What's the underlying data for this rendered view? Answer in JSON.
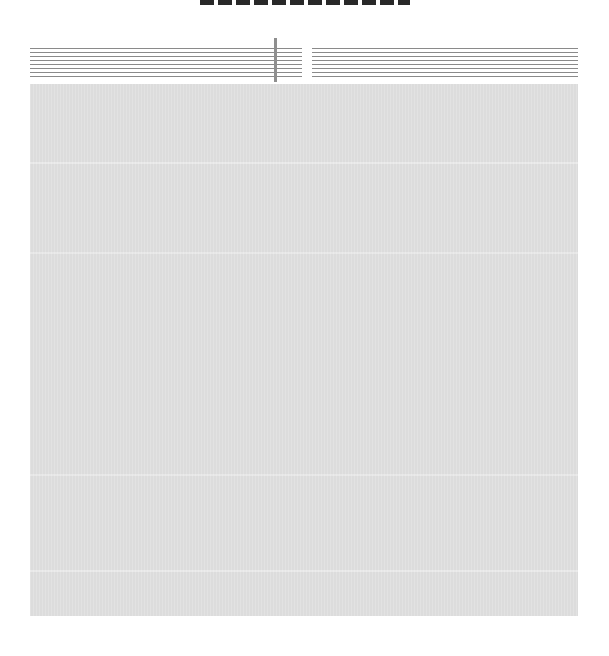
{
  "title": {
    "text": null,
    "note_visible": "cropped-at-top"
  },
  "header": {
    "left_column": {
      "line_count": 8
    },
    "right_column": {
      "line_count": 8
    },
    "divider": {
      "visible": true
    }
  },
  "body": {
    "text_content": null,
    "fill_color": "#dcdcdc"
  },
  "colors": {
    "background": "#ffffff",
    "rule_lines": "#8a8a8a",
    "divider": "#8f8f8f",
    "block_fill": "#dcdcdc"
  }
}
